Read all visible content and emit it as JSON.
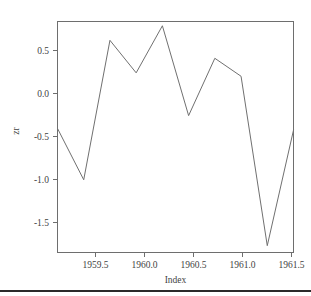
{
  "chart_data": {
    "type": "line",
    "title": "",
    "subtitle": "",
    "xlabel": "Index",
    "ylabel": "zr",
    "xlim": [
      1959.25,
      1961.5
    ],
    "ylim": [
      -1.78,
      0.92
    ],
    "grid": false,
    "legend": null,
    "xticks": [
      "1959.5",
      "1960.0",
      "1960.5",
      "1961.0",
      "1961.5"
    ],
    "xtick_values": [
      1959.5,
      1960.0,
      1960.5,
      1961.0,
      1961.5
    ],
    "yticks": [
      "0.5",
      "0.0",
      "-0.5",
      "-1.0",
      "-1.5"
    ],
    "ytick_values": [
      0.5,
      0.0,
      -0.5,
      -1.0,
      -1.5
    ],
    "line_color": "#707070",
    "frame_color": "#6e6e6e",
    "x": [
      1959.25,
      1959.5,
      1959.75,
      1960.0,
      1960.25,
      1960.5,
      1960.75,
      1961.0,
      1961.25,
      1961.5
    ],
    "values": [
      -0.33,
      -0.93,
      0.7,
      0.32,
      0.87,
      -0.18,
      0.49,
      0.28,
      -1.7,
      -0.35
    ],
    "series": [
      {
        "name": "zr",
        "values": [
          -0.33,
          -0.93,
          0.7,
          0.32,
          0.87,
          -0.18,
          0.49,
          0.28,
          -1.7,
          -0.35
        ]
      }
    ]
  },
  "figure": {
    "y_axis_label": "zr",
    "x_axis_label": "Index"
  }
}
